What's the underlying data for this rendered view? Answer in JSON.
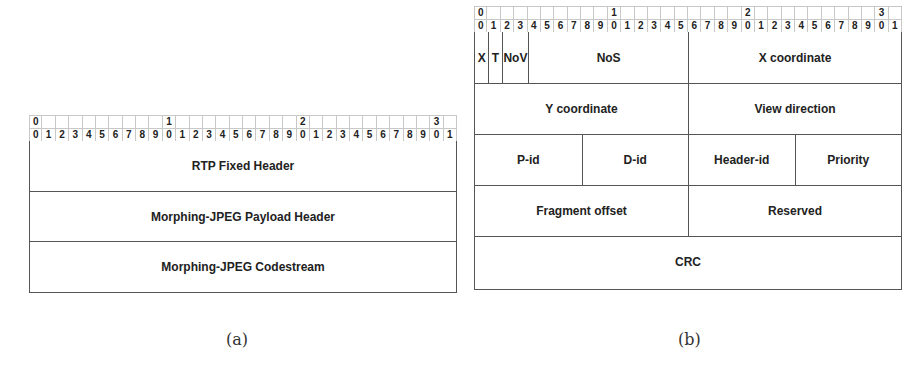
{
  "ruler": {
    "tens": [
      "0",
      "",
      "",
      "",
      "",
      "",
      "",
      "",
      "",
      "",
      "1",
      "",
      "",
      "",
      "",
      "",
      "",
      "",
      "",
      "",
      "2",
      "",
      "",
      "",
      "",
      "",
      "",
      "",
      "",
      "",
      "3",
      ""
    ],
    "units": [
      "0",
      "1",
      "2",
      "3",
      "4",
      "5",
      "6",
      "7",
      "8",
      "9",
      "0",
      "1",
      "2",
      "3",
      "4",
      "5",
      "6",
      "7",
      "8",
      "9",
      "0",
      "1",
      "2",
      "3",
      "4",
      "5",
      "6",
      "7",
      "8",
      "9",
      "0",
      "1"
    ]
  },
  "diagram_a": {
    "caption": "(a)",
    "rows": [
      {
        "fields": [
          {
            "label": "RTP Fixed Header",
            "bits": 32
          }
        ]
      },
      {
        "fields": [
          {
            "label": "Morphing-JPEG Payload Header",
            "bits": 32
          }
        ]
      },
      {
        "fields": [
          {
            "label": "Morphing-JPEG Codestream",
            "bits": 32
          }
        ]
      }
    ]
  },
  "diagram_b": {
    "caption": "(b)",
    "rows": [
      {
        "fields": [
          {
            "label": "X",
            "bits": 1
          },
          {
            "label": "T",
            "bits": 1
          },
          {
            "label": "NoV",
            "bits": 2
          },
          {
            "label": "NoS",
            "bits": 12
          },
          {
            "label": "X coordinate",
            "bits": 16
          }
        ]
      },
      {
        "fields": [
          {
            "label": "Y coordinate",
            "bits": 16
          },
          {
            "label": "View direction",
            "bits": 16
          }
        ]
      },
      {
        "fields": [
          {
            "label": "P-id",
            "bits": 8
          },
          {
            "label": "D-id",
            "bits": 8
          },
          {
            "label": "Header-id",
            "bits": 8
          },
          {
            "label": "Priority",
            "bits": 8
          }
        ]
      },
      {
        "fields": [
          {
            "label": "Fragment offset",
            "bits": 16
          },
          {
            "label": "Reserved",
            "bits": 16
          }
        ]
      },
      {
        "fields": [
          {
            "label": "CRC",
            "bits": 32
          }
        ]
      }
    ]
  }
}
